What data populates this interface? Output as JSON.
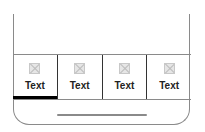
{
  "tabbar": {
    "active_index": 0,
    "tabs": [
      {
        "label": "Text",
        "icon": "image-placeholder-icon"
      },
      {
        "label": "Text",
        "icon": "image-placeholder-icon"
      },
      {
        "label": "Text",
        "icon": "image-placeholder-icon"
      },
      {
        "label": "Text",
        "icon": "image-placeholder-icon"
      }
    ]
  },
  "colors": {
    "frame": "#8a8a8a",
    "active_indicator": "#000000",
    "icon_placeholder": "#e6e6e6"
  }
}
